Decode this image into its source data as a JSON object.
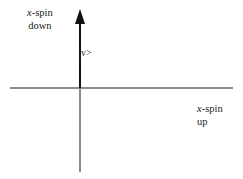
{
  "figure": {
    "background_color": "#ffffff",
    "width": 243,
    "height": 179
  },
  "axes": {
    "horizontal_color": "#8c8c8c",
    "vertical_color": "#8c8c8c",
    "origin_x": 80,
    "origin_y": 88
  },
  "vector": {
    "name": "state-vector",
    "color": "#111111",
    "direction": "up",
    "ket_label": "|v>"
  },
  "labels": {
    "spin_down": {
      "variable": "x",
      "line1_suffix": "-spin",
      "line2": "down"
    },
    "spin_up": {
      "variable": "x",
      "line1_suffix": "-spin",
      "line2": "up"
    }
  },
  "chart_data": {
    "type": "scatter",
    "title": "",
    "xlabel": "x-spin up",
    "ylabel": "x-spin down",
    "annotations": [
      {
        "text": "|v>",
        "x": 0,
        "y": 0.75
      },
      {
        "text": "x-spin down",
        "x": -0.55,
        "y": 1.0
      },
      {
        "text": "x-spin up",
        "x": 1.1,
        "y": -0.2
      }
    ],
    "series": [
      {
        "name": "|v>",
        "type": "vector",
        "origin": [
          0,
          0
        ],
        "tip": [
          0,
          1
        ]
      }
    ],
    "xlim": [
      -0.8,
      1.45
    ],
    "ylim": [
      -0.95,
      1.05
    ],
    "grid": false,
    "legend": false
  }
}
